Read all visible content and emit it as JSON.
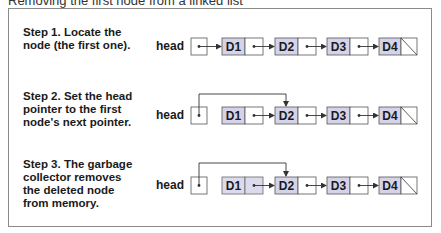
{
  "title": "Removing the first node from a linked list",
  "steps": [
    {
      "text": "Step 1. Locate the node (the first one).",
      "lines": [
        "Step 1. Locate the",
        "node (the first one)."
      ]
    },
    {
      "text": "Step 2. Set the head pointer to the first node's next pointer.",
      "lines": [
        "Step 2. Set the head",
        "pointer to the first",
        "node's next pointer."
      ]
    },
    {
      "text": "Step 3. The garbage collector removes the deleted node from memory.",
      "lines": [
        "Step 3. The garbage",
        "collector removes",
        "the deleted node",
        "from memory."
      ]
    }
  ],
  "head_label": "head",
  "nodes": [
    "D1",
    "D2",
    "D3",
    "D4"
  ],
  "colors": {
    "node_fill": "#d4d3ea",
    "deleted_fill": "#dcdbee",
    "line": "#333333",
    "frame": "#8a8a8a"
  }
}
